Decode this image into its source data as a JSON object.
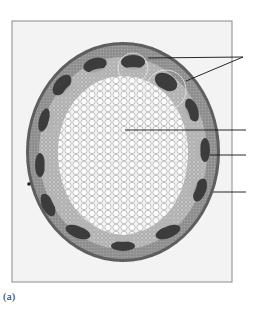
{
  "figure": {
    "caption": "(a)",
    "frame": {
      "x": 12,
      "y": 21,
      "width": 220,
      "height": 261
    },
    "stem": {
      "cx": 123,
      "cy": 152,
      "rx": 97,
      "ry": 110
    },
    "highlight_circles": [
      {
        "cx": 133,
        "cy": 68,
        "r": 15
      },
      {
        "cx": 166,
        "cy": 90,
        "r": 20
      }
    ],
    "leader_lines": [
      {
        "id": "line-1a",
        "x1": 148,
        "y1": 58,
        "x2": 243,
        "y2": 57
      },
      {
        "id": "line-1b",
        "x1": 186,
        "y1": 81,
        "x2": 243,
        "y2": 57
      },
      {
        "id": "line-2",
        "x1": 125,
        "y1": 130,
        "x2": 246,
        "y2": 130
      },
      {
        "id": "line-3",
        "x1": 210,
        "y1": 155,
        "x2": 246,
        "y2": 155
      },
      {
        "id": "line-4",
        "x1": 213,
        "y1": 192,
        "x2": 246,
        "y2": 192
      }
    ],
    "colors": {
      "frame_fill": "#f3f3f3",
      "frame_stroke": "#8a8a8a",
      "cortex": "#9a9a9a",
      "epidermis": "#5a5a5a",
      "bundle": "#3e3e3e",
      "pith": "#f2f2f2",
      "pith_cell_line": "#b0b0b0",
      "leader": "#111111"
    }
  }
}
